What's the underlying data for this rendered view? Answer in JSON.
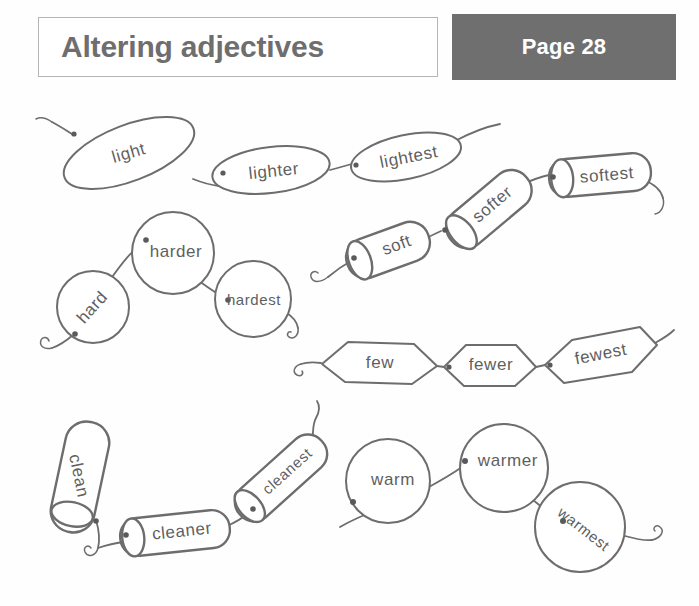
{
  "header": {
    "title": "Altering adjectives",
    "page_badge": "Page 28",
    "title_border_color": "#b5b5b5",
    "title_text_color": "#6e6e6e",
    "badge_bg_color": "#6f6f6f",
    "badge_text_color": "#ffffff"
  },
  "worksheet": {
    "ink_color": "#6d6d6d",
    "paper_color": "#fefefe",
    "bead_fill": "#ffffff",
    "chains": [
      {
        "id": "light-chain",
        "bead_shape": "ellipse",
        "beads": [
          {
            "label": "light"
          },
          {
            "label": "lighter"
          },
          {
            "label": "lightest"
          }
        ]
      },
      {
        "id": "soft-chain",
        "bead_shape": "cylinder",
        "beads": [
          {
            "label": "soft"
          },
          {
            "label": "softer"
          },
          {
            "label": "softest"
          }
        ]
      },
      {
        "id": "hard-chain",
        "bead_shape": "circle",
        "beads": [
          {
            "label": "hard"
          },
          {
            "label": "harder"
          },
          {
            "label": "hardest"
          }
        ]
      },
      {
        "id": "few-chain",
        "bead_shape": "hexagon",
        "beads": [
          {
            "label": "few"
          },
          {
            "label": "fewer"
          },
          {
            "label": "fewest"
          }
        ]
      },
      {
        "id": "clean-chain",
        "bead_shape": "cylinder",
        "beads": [
          {
            "label": "clean"
          },
          {
            "label": "cleaner"
          },
          {
            "label": "cleanest"
          }
        ]
      },
      {
        "id": "warm-chain",
        "bead_shape": "circle",
        "beads": [
          {
            "label": "warm"
          },
          {
            "label": "warmer"
          },
          {
            "label": "warmest"
          }
        ]
      }
    ]
  }
}
